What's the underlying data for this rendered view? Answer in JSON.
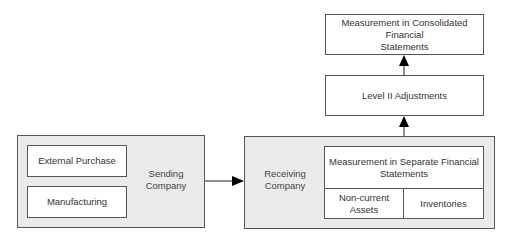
{
  "diagram": {
    "sending_company": {
      "label": "Sending Company",
      "label_line1": "Sending",
      "label_line2": "Company",
      "sources": [
        {
          "label": "External Purchase"
        },
        {
          "label": "Manufacturing"
        }
      ]
    },
    "receiving_company": {
      "label_line1": "Receiving",
      "label_line2": "Company",
      "separate_statements": {
        "label": "Measurement in Separate Financial Statements",
        "line1": "Measurement in Separate Financial",
        "line2": "Statements",
        "cells": [
          {
            "label": "Non-current Assets"
          },
          {
            "label": "Inventories"
          }
        ]
      }
    },
    "level2_adjustments": {
      "label": "Level II Adjustments"
    },
    "consolidated": {
      "line1": "Measurement in Consolidated Financial",
      "line2": "Statements"
    },
    "edges": [
      {
        "from": "Sending Company",
        "to": "Receiving Company"
      },
      {
        "from": "Measurement in Separate Financial Statements",
        "to": "Level II Adjustments"
      },
      {
        "from": "Level II Adjustments",
        "to": "Measurement in Consolidated Financial Statements"
      }
    ],
    "colors": {
      "group_fill": "#ebebeb",
      "border": "#555555",
      "arrow": "#000000"
    }
  }
}
